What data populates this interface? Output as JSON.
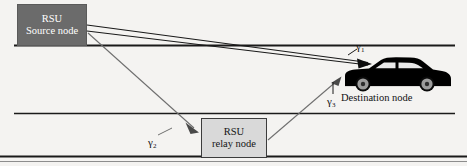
{
  "figure": {
    "background_color": "#f4f3f1"
  },
  "nodes": {
    "source": {
      "line1": "RSU",
      "line2": "Source node",
      "fill_color": "#6b6b6b",
      "text_color": "#ffffff"
    },
    "relay": {
      "line1": "RSU",
      "line2": "relay node",
      "fill_color": "#d9d9d9",
      "text_color": "#141414"
    },
    "destination": {
      "label": "Destination node",
      "vehicle": "black-sedan",
      "body_color": "#000000",
      "window_color": "#e8e8e8"
    }
  },
  "links": {
    "gamma1": {
      "symbol": "γ",
      "subscript": "1",
      "description": "source-to-destination direct link"
    },
    "gamma2": {
      "symbol": "γ",
      "subscript": "2",
      "description": "source-to-relay link"
    },
    "gamma3": {
      "symbol": "γ",
      "subscript": "3",
      "description": "relay-to-destination link"
    }
  },
  "road": {
    "line_color": "#1a1a1a",
    "lanes": 2
  }
}
